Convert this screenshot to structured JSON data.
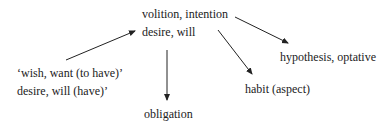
{
  "nodes": {
    "volition": "volition, intention",
    "desire": "desire, will",
    "wish": "‘wish, want (to have)’",
    "desire_have": "desire, will (have)’",
    "obligation": "obligation",
    "hypothesis": "hypothesis, optative",
    "habit": "habit (aspect)"
  },
  "edges": [
    {
      "from": "wish",
      "to": "desire"
    },
    {
      "from": "desire",
      "to": "obligation"
    },
    {
      "from": "desire",
      "to": "habit"
    },
    {
      "from": "volition",
      "to": "hypothesis"
    }
  ]
}
